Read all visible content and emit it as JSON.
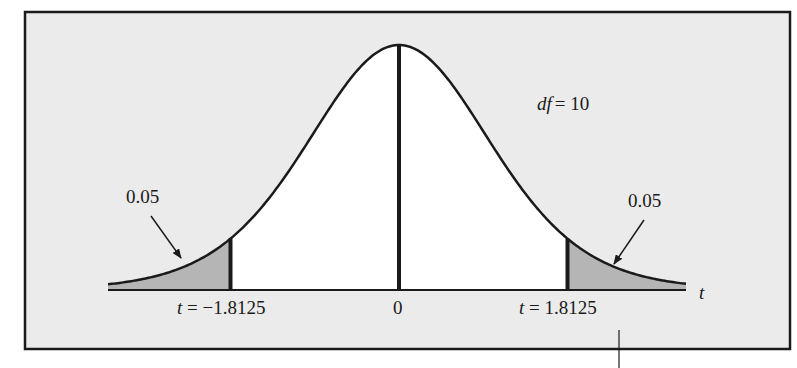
{
  "chart_data": {
    "type": "area",
    "title": "",
    "distribution": "Student t",
    "df_label": "df = 10",
    "df": 10,
    "xlabel": "t",
    "ylabel": "",
    "grid": false,
    "legend": "none",
    "center_label": "0",
    "critical_values": [
      -1.8125,
      1.8125
    ],
    "critical_labels": [
      "t = −1.8125",
      "t = 1.8125"
    ],
    "tail_areas": [
      {
        "side": "left",
        "area": 0.05,
        "label": "0.05",
        "region": "t < -1.8125"
      },
      {
        "side": "right",
        "area": 0.05,
        "label": "0.05",
        "region": "t > 1.8125"
      }
    ],
    "colors": {
      "background": "#ebebeb",
      "curve_fill": "#ffffff",
      "tail_fill": "#b5b5b5",
      "stroke": "#1a1a1a"
    }
  },
  "labels": {
    "df_italic": "df",
    "df_rest": "= 10",
    "left_tail": "0.05",
    "right_tail": "0.05",
    "left_crit_t": "t",
    "left_crit_rest": " = −1.8125",
    "center": "0",
    "right_crit_t": "t",
    "right_crit_rest": " = 1.8125",
    "axis": "t"
  }
}
